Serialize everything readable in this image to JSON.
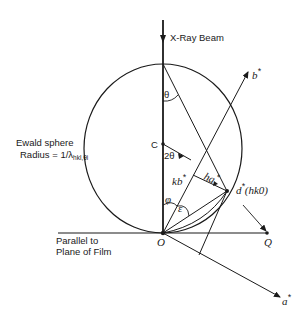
{
  "labels": {
    "beam": "X-Ray Beam",
    "ewald_line1": "Ewald sphere",
    "ewald_line2_prefix": "Radius = 1/λ",
    "ewald_line2_sub": "hkl,θi",
    "theta": "θ",
    "center": "C",
    "two_theta": "2θ",
    "kb": "kb",
    "ha": "ha",
    "phi": "φ",
    "epsilon": "ε",
    "star": "*",
    "d_star": "d",
    "d_star_hkl": "(hk0)",
    "origin": "O",
    "q": "Q",
    "b_star": "b",
    "a_star": "a",
    "film_line1": "Parallel to",
    "film_line2": "Plane of Film"
  },
  "colors": {
    "ink": "#1a1a1a",
    "background": "#ffffff"
  }
}
